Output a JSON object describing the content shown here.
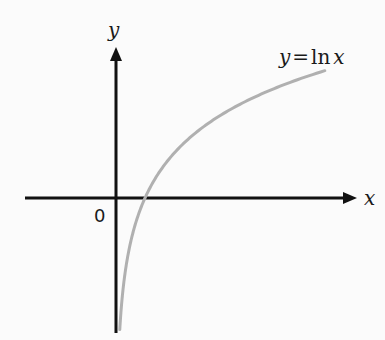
{
  "chart_data": {
    "type": "line",
    "title": "",
    "function": "y = ln x",
    "series": [
      {
        "name": "y = ln x",
        "color": "#b0b0b0",
        "x": [
          0.13,
          0.2,
          0.3,
          0.5,
          0.75,
          1,
          1.5,
          2,
          3,
          4,
          5,
          6,
          7.2
        ],
        "y": [
          -2.04,
          -1.61,
          -1.2,
          -0.69,
          -0.29,
          0,
          0.41,
          0.69,
          1.1,
          1.39,
          1.61,
          1.79,
          1.97
        ]
      }
    ],
    "xlabel": "x",
    "ylabel": "y",
    "origin_label": "0",
    "curve_label": {
      "lhs": "y",
      "eq": "=",
      "fn": "ln",
      "arg": "x"
    },
    "xlim": [
      -3.1,
      8.3
    ],
    "ylim": [
      -2.1,
      2.35
    ],
    "grid": false
  }
}
